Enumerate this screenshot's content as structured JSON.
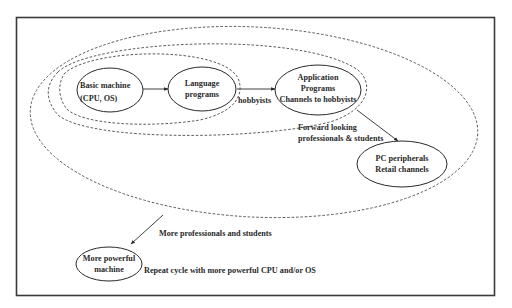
{
  "diagram": {
    "type": "nested-cycle-flow",
    "nodes": [
      {
        "id": "basic",
        "lines": [
          "Basic machine",
          "(CPU, OS)"
        ]
      },
      {
        "id": "language",
        "lines": [
          "Language",
          "programs"
        ]
      },
      {
        "id": "application",
        "lines": [
          "Application",
          "Programs",
          "Channels to hobbyists"
        ]
      },
      {
        "id": "pc",
        "lines": [
          "PC peripherals",
          "Retail channels"
        ]
      },
      {
        "id": "more_powerful",
        "lines": [
          "More powerful",
          "machine"
        ]
      }
    ],
    "edge_labels": {
      "hobbyists": "hobbyists",
      "forward_1": "Forward looking",
      "forward_2": "professionals & students",
      "more_prof": "More professionals and students",
      "repeat": "Repeat cycle with more powerful CPU and/or OS"
    },
    "edges": [
      {
        "from": "basic",
        "to": "language"
      },
      {
        "from": "language",
        "to": "application",
        "label": "hobbyists"
      },
      {
        "from": "application",
        "to": "pc",
        "label": "Forward looking professionals & students"
      },
      {
        "from": "outer-group",
        "to": "more_powerful",
        "label": "More professionals and students"
      }
    ],
    "groups": [
      {
        "id": "inner-group",
        "contains": [
          "basic",
          "language"
        ],
        "style": "dashed"
      },
      {
        "id": "middle-group",
        "contains": [
          "basic",
          "language",
          "application"
        ],
        "style": "dashed"
      },
      {
        "id": "outer-group",
        "contains": [
          "basic",
          "language",
          "application",
          "pc"
        ],
        "style": "dashed"
      }
    ]
  },
  "colors": {
    "line": "#2a2a2a",
    "frame": "#3a3a3a",
    "background": "#ffffff"
  }
}
